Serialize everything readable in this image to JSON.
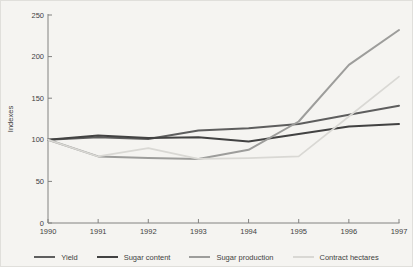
{
  "chart_data": {
    "type": "line",
    "title": "",
    "xlabel": "",
    "ylabel": "Indexes",
    "ylim": [
      0,
      250
    ],
    "y_ticks": [
      0,
      50,
      100,
      150,
      200,
      250
    ],
    "categories": [
      "1990",
      "1991",
      "1992",
      "1993",
      "1994",
      "1995",
      "1996",
      "1997"
    ],
    "grid": "off",
    "legend_position": "bottom",
    "series": [
      {
        "name": "Yield",
        "color": "#5e5e5e",
        "width": 2,
        "values": [
          100,
          103,
          101,
          111,
          114,
          119,
          130,
          141
        ]
      },
      {
        "name": "Sugar content",
        "color": "#424242",
        "width": 2,
        "values": [
          100,
          105,
          102,
          103,
          98,
          107,
          116,
          119
        ]
      },
      {
        "name": "Sugar production",
        "color": "#9d9d9b",
        "width": 2,
        "values": [
          100,
          80,
          78,
          77,
          88,
          122,
          190,
          232
        ]
      },
      {
        "name": "Contract hectares",
        "color": "#d9d8d4",
        "width": 1.6,
        "values": [
          100,
          80,
          90,
          77,
          78,
          80,
          128,
          176
        ]
      }
    ],
    "axis_color": "#828280",
    "text_color": "#3f3f3f"
  }
}
